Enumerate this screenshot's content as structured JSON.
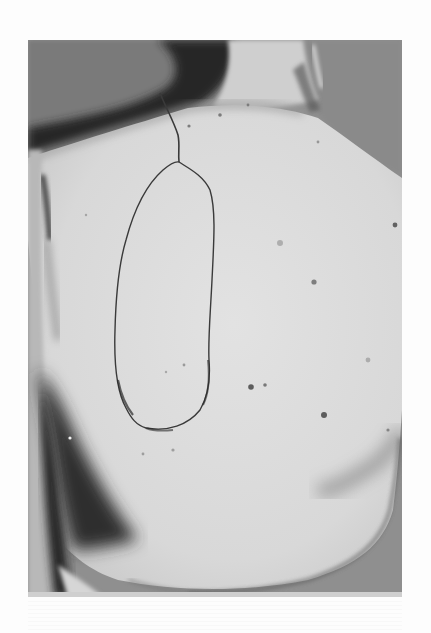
{
  "image": {
    "type": "grayscale clinical photograph",
    "subject": "posterior view of patient's upper back",
    "annotation": "hand-drawn elliptical flap outline with pedicle line extending toward the neck",
    "colors": {
      "background": "#fdfdfd",
      "skin": "#d9d9d9",
      "skin_highlight": "#e4e4e4",
      "shadow": "#4a4a4a",
      "dark_shadow": "#2e2e2e",
      "drape_gray": "#8e8e8e",
      "outline": "#3a3a3a",
      "spots": "#555555"
    }
  }
}
